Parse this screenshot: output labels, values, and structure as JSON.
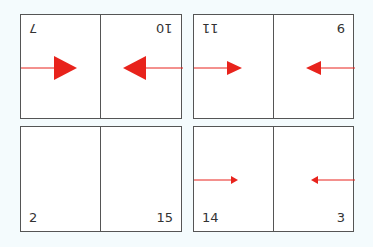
{
  "colors": {
    "arrow": "#e8231c",
    "line": "#e8231c",
    "border": "#555555",
    "background": "#f4fbfd"
  },
  "panels": [
    {
      "id": "top-left",
      "left_number": "7",
      "right_number": "10",
      "numbers_inverted": true,
      "arrow_size": "large"
    },
    {
      "id": "top-right",
      "left_number": "11",
      "right_number": "6",
      "left_inverted": true,
      "arrow_size": "medium"
    },
    {
      "id": "bottom-left",
      "left_number": "2",
      "right_number": "15",
      "arrow_size": "none"
    },
    {
      "id": "bottom-right",
      "left_number": "14",
      "right_number": "3",
      "arrow_size": "small"
    }
  ]
}
